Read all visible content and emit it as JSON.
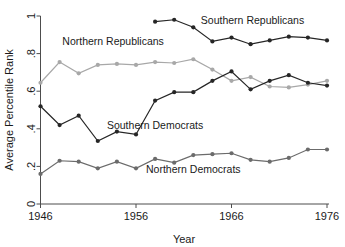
{
  "chart_data": {
    "type": "line",
    "title": "",
    "xlabel": "Year",
    "ylabel": "Average Percentile Rank",
    "xlim": [
      1946,
      1976
    ],
    "ylim": [
      0,
      1
    ],
    "xticks": [
      1946,
      1956,
      1966,
      1976
    ],
    "xticklabels": [
      "1946",
      "1956",
      "1966",
      "1976"
    ],
    "yticks": [
      0,
      0.2,
      0.4,
      0.6,
      0.8,
      1
    ],
    "yticklabels": [
      "0",
      ".2",
      ".4",
      ".6",
      ".8",
      "1"
    ],
    "grid": false,
    "legend_position": "inline-annotations",
    "series": [
      {
        "name": "Southern Republicans",
        "color": "#262626",
        "label_x": 1968.2,
        "label_y": 0.955,
        "x": [
          1958,
          1960,
          1962,
          1964,
          1966,
          1968,
          1970,
          1972,
          1974,
          1976
        ],
        "values": [
          0.97,
          0.98,
          0.94,
          0.865,
          0.885,
          0.85,
          0.87,
          0.89,
          0.885,
          0.87
        ]
      },
      {
        "name": "Northern Republicans",
        "color": "#a8a8a8",
        "label_x": 1953.6,
        "label_y": 0.845,
        "x": [
          1946,
          1948,
          1950,
          1952,
          1954,
          1956,
          1958,
          1960,
          1962,
          1964,
          1966,
          1968,
          1970,
          1972,
          1974,
          1976
        ],
        "values": [
          0.645,
          0.755,
          0.695,
          0.74,
          0.745,
          0.74,
          0.755,
          0.75,
          0.77,
          0.715,
          0.655,
          0.675,
          0.625,
          0.62,
          0.635,
          0.655
        ]
      },
      {
        "name": "Southern Democrats",
        "color": "#262626",
        "label_x": 1958.0,
        "label_y": 0.4,
        "x": [
          1946,
          1948,
          1950,
          1952,
          1954,
          1956,
          1958,
          1960,
          1962,
          1964,
          1966,
          1968,
          1970,
          1972,
          1974,
          1976
        ],
        "values": [
          0.52,
          0.42,
          0.47,
          0.335,
          0.385,
          0.37,
          0.55,
          0.595,
          0.595,
          0.655,
          0.705,
          0.61,
          0.655,
          0.685,
          0.645,
          0.63
        ]
      },
      {
        "name": "Northern Democrats",
        "color": "#6b6b6b",
        "label_x": 1962.0,
        "label_y": 0.165,
        "x": [
          1946,
          1948,
          1950,
          1952,
          1954,
          1956,
          1958,
          1960,
          1962,
          1964,
          1966,
          1968,
          1970,
          1972,
          1974,
          1976
        ],
        "values": [
          0.16,
          0.23,
          0.225,
          0.19,
          0.225,
          0.19,
          0.24,
          0.22,
          0.26,
          0.265,
          0.27,
          0.235,
          0.225,
          0.245,
          0.29,
          0.29
        ]
      }
    ]
  },
  "axes": {
    "x_title": "Year",
    "y_title": "Average Percentile Rank"
  }
}
